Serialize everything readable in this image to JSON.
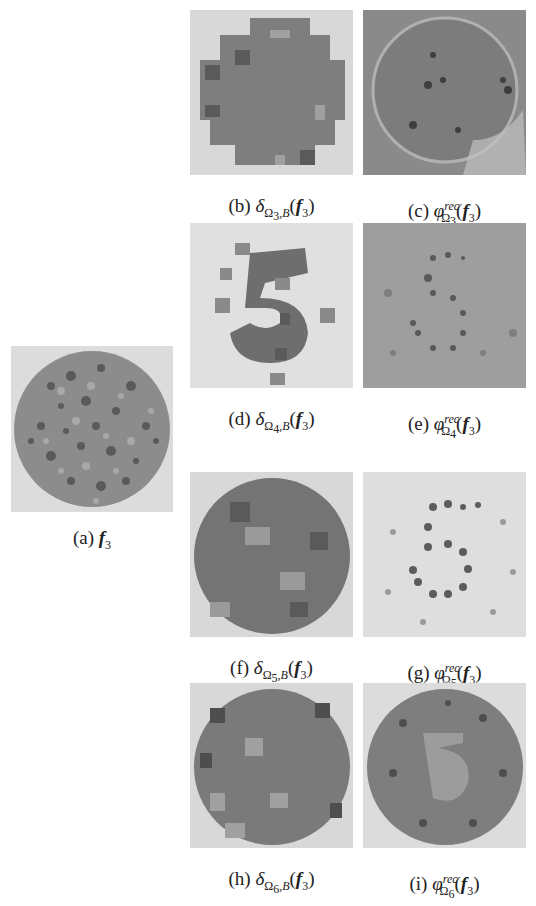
{
  "figure": {
    "panels": [
      {
        "id": "a",
        "label": "(a)",
        "math": "f_3",
        "main": "f",
        "sub": "3",
        "kind": "original"
      },
      {
        "id": "b",
        "label": "(b)",
        "math": "δ_{Ω_3,B}(f_3)",
        "sym": "δ",
        "sub": "Ω",
        "subsub": "3",
        "subtail": ",B",
        "kind": "delta"
      },
      {
        "id": "c",
        "label": "(c)",
        "math": "φ^{rec}_{Ω_3}(f_3)",
        "sym": "φ",
        "sup": "rec",
        "sub": "Ω",
        "subsub": "3",
        "kind": "rec"
      },
      {
        "id": "d",
        "label": "(d)",
        "math": "δ_{Ω_4,B}(f_3)",
        "sym": "δ",
        "sub": "Ω",
        "subsub": "4",
        "subtail": ",B",
        "kind": "delta"
      },
      {
        "id": "e",
        "label": "(e)",
        "math": "φ^{rec}_{Ω_4}(f_3)",
        "sym": "φ",
        "sup": "rec",
        "sub": "Ω",
        "subsub": "4",
        "kind": "rec"
      },
      {
        "id": "f",
        "label": "(f)",
        "math": "δ_{Ω_5,B}(f_3)",
        "sym": "δ",
        "sub": "Ω",
        "subsub": "5",
        "subtail": ",B",
        "kind": "delta"
      },
      {
        "id": "g",
        "label": "(g)",
        "math": "φ^{rec}_{Ω_5}(f_3)",
        "sym": "φ",
        "sup": "rec",
        "sub": "Ω",
        "subsub": "5",
        "kind": "rec"
      },
      {
        "id": "h",
        "label": "(h)",
        "math": "δ_{Ω_6,B}(f_3)",
        "sym": "δ",
        "sub": "Ω",
        "subsub": "6",
        "subtail": ",B",
        "kind": "delta"
      },
      {
        "id": "i",
        "label": "(i)",
        "math": "φ^{rec}_{Ω_6}(f_3)",
        "sym": "φ",
        "sup": "rec",
        "sub": "Ω",
        "subsub": "6",
        "kind": "rec"
      }
    ],
    "common": {
      "arg_open": "(",
      "arg_main": "f",
      "arg_sub": "3",
      "arg_close": ")"
    },
    "colors": {
      "background": "#d9d9d9",
      "dot_light": "#9a9a9a",
      "dot_mid": "#7a7a7a",
      "dot_dark": "#4a4a4a",
      "block": "#7e7e7e"
    }
  }
}
